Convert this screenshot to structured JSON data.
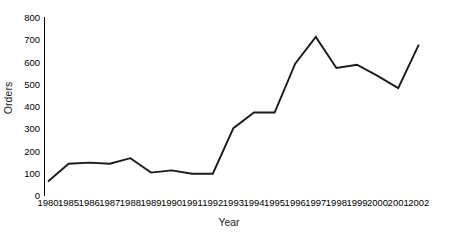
{
  "chart_data": {
    "type": "line",
    "title": "",
    "xlabel": "Year",
    "ylabel": "Orders",
    "categories": [
      "1980",
      "1985",
      "1986",
      "1987",
      "1988",
      "1989",
      "1990",
      "1991",
      "1992",
      "1993",
      "1994",
      "1995",
      "1996",
      "1997",
      "1998",
      "1999",
      "2000",
      "2001",
      "2002"
    ],
    "values": [
      65,
      145,
      150,
      145,
      170,
      105,
      115,
      100,
      100,
      305,
      375,
      375,
      595,
      715,
      575,
      590,
      540,
      485,
      680
    ],
    "series": [
      {
        "name": "Orders",
        "values": [
          65,
          145,
          150,
          145,
          170,
          105,
          115,
          100,
          100,
          305,
          375,
          375,
          595,
          715,
          575,
          590,
          540,
          485,
          680
        ]
      }
    ],
    "ylim": [
      0,
      800
    ],
    "yticks": [
      0,
      100,
      200,
      300,
      400,
      500,
      600,
      700,
      800
    ],
    "ytick_labels": [
      "0",
      "100",
      "200",
      "300",
      "400",
      "500",
      "600",
      "700",
      "800"
    ],
    "grid": false,
    "legend": false,
    "legend_position": "none",
    "line_color": "#1a1a1a",
    "axis_color": "#000000",
    "background_color": "#ffffff"
  }
}
